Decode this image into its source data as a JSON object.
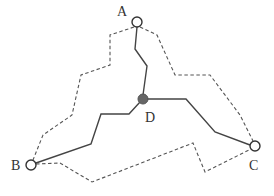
{
  "diagram": {
    "type": "network-paths",
    "nodes": [
      {
        "id": "A",
        "label": "A",
        "x": 137,
        "y": 22,
        "r": 5,
        "style": "open",
        "label_x": 117,
        "label_y": 16
      },
      {
        "id": "B",
        "label": "B",
        "x": 31,
        "y": 165,
        "r": 5,
        "style": "open",
        "label_x": 11,
        "label_y": 170
      },
      {
        "id": "C",
        "label": "C",
        "x": 255,
        "y": 146,
        "r": 5,
        "style": "open",
        "label_x": 249,
        "label_y": 170
      },
      {
        "id": "D",
        "label": "D",
        "x": 143,
        "y": 99,
        "r": 5,
        "style": "filled",
        "label_x": 145,
        "label_y": 122
      }
    ],
    "solid_paths": [
      {
        "from": "A",
        "to": "D",
        "points": "137,27 135,49 147,66 143,95"
      },
      {
        "from": "D",
        "to": "B",
        "points": "140,102 129,114 101,114 91,144 36,163"
      },
      {
        "from": "D",
        "to": "C",
        "points": "147,99 186,99 215,132 250,145"
      }
    ],
    "dashed_paths": [
      {
        "from": "A",
        "to": "B",
        "points": "134,27 110,35 110,65 81,75 72,115 43,135 33,160"
      },
      {
        "from": "A",
        "to": "C",
        "points": "140,27 157,35 175,75 210,75 240,115 253,141"
      },
      {
        "from": "B",
        "to": "C",
        "points": "36,164 60,163 92,182 193,143 205,172 251,149"
      }
    ],
    "colors": {
      "solid_line": "#444444",
      "dashed_line": "#555555",
      "open_node_stroke": "#333333",
      "filled_node": "#666666",
      "label": "#333333",
      "background": "#ffffff"
    }
  }
}
